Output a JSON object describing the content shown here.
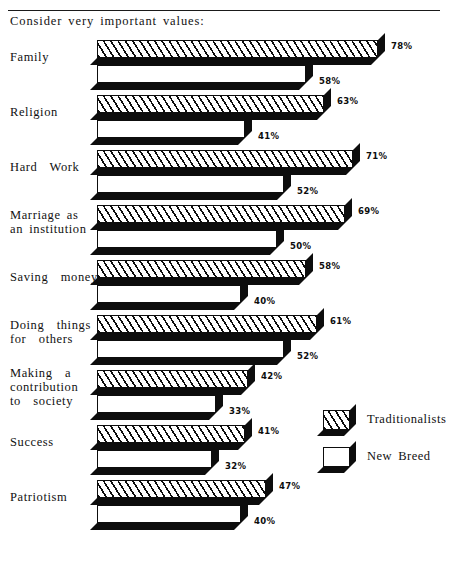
{
  "header": {
    "title": "Consider very important values:",
    "rule": "horizontal-rule"
  },
  "legend": {
    "items": [
      {
        "label": "Traditionalists",
        "swatch": "hatched"
      },
      {
        "label": "New  Breed",
        "swatch": "white"
      }
    ]
  },
  "chart_data": {
    "type": "bar",
    "orientation": "horizontal",
    "title": "Consider very important values:",
    "xlabel": "",
    "ylabel": "",
    "xlim": [
      0,
      100
    ],
    "grid": false,
    "legend_position": "right-middle",
    "value_suffix": "%",
    "categories": [
      "Family",
      "Religion",
      "Hard  Work",
      "Marriage as\nan institution",
      "Saving  money",
      "Doing  things\nfor  others",
      "Making  a\ncontribution\nto  society",
      "Success",
      "Patriotism"
    ],
    "series": [
      {
        "name": "Traditionalists",
        "values": [
          78,
          63,
          71,
          69,
          58,
          61,
          42,
          41,
          47
        ],
        "labels": [
          "78%",
          "63%",
          "71%",
          "69%",
          "58%",
          "61%",
          "42%",
          "41%",
          "47%"
        ]
      },
      {
        "name": "New  Breed",
        "values": [
          58,
          41,
          52,
          50,
          40,
          52,
          33,
          32,
          40
        ],
        "labels": [
          "58%",
          "41%",
          "52%",
          "50%",
          "40%",
          "52%",
          "33%",
          "32%",
          "40%"
        ]
      }
    ]
  },
  "colors": {
    "ink": "#0d0d0d",
    "paper": "#ffffff"
  }
}
